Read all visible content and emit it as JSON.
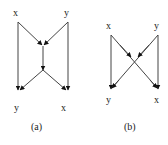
{
  "diagrams": [
    {
      "caption": "(a)",
      "labels": {
        "top_left": "x",
        "top_right": "y",
        "bottom_left": "y",
        "bottom_right": "x"
      },
      "description": "Butterfly-shaped flow: x and y merge into a center node, single arrow down, then split to y and x; side edges run vertically from x to y and y to x"
    },
    {
      "caption": "(b)",
      "labels": {
        "top_left": "x",
        "top_right": "y",
        "bottom_left": "y",
        "bottom_right": "x"
      },
      "description": "Cross-shaped flow: x and y connect diagonally crossing in the middle, with vertical side edges from x to y and y to x"
    }
  ],
  "colors": {
    "line": "#444444",
    "arrowhead": "#111111",
    "text": "#222222"
  }
}
